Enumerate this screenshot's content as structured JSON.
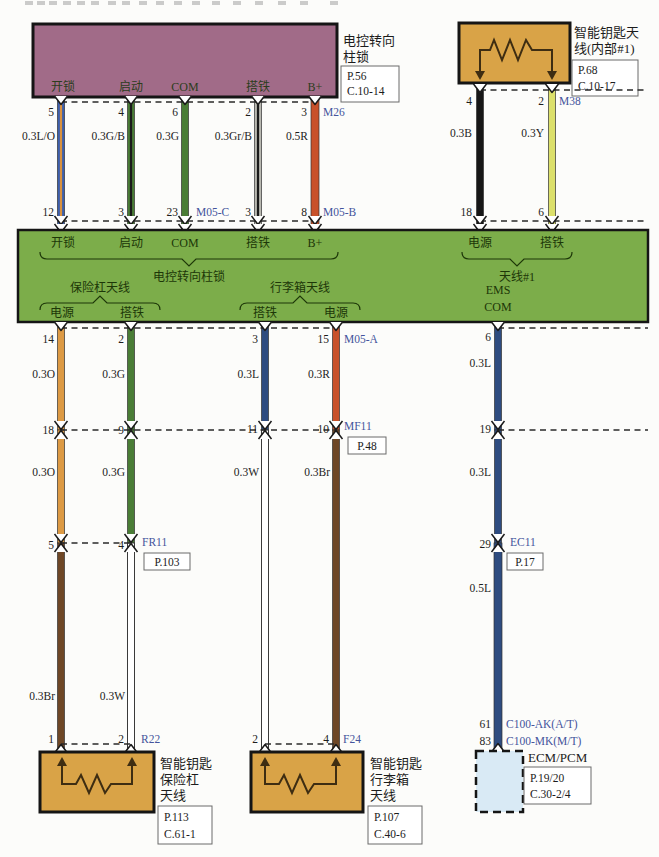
{
  "colors": {
    "purple_box": "#a16b88",
    "green_band": "#7cad4a",
    "orange_box": "#d9a347",
    "ecm_box": "#d9eaf5",
    "wire_blue": "#3c5fae",
    "wire_blue_stripe": "#d8913f",
    "wire_green": "#4a7d36",
    "wire_gray": "#b9b9b1",
    "wire_red": "#c8512a",
    "wire_black": "#161616",
    "wire_yellow": "#dce06b",
    "wire_orange": "#dd9a44",
    "wire_navy": "#2e4c80",
    "wire_brown": "#6e4726",
    "wire_white": "#ffffff",
    "stripe_black": "#1a1a1a",
    "connector_text": "#44549c"
  },
  "steering_lock": {
    "name1": "电控转向",
    "name2": "柱锁",
    "ref1": "P.56",
    "ref2": "C.10-14",
    "pins": [
      "开锁",
      "启动",
      "COM",
      "搭铁",
      "B+"
    ],
    "top_nums": [
      "5",
      "4",
      "6",
      "2",
      "3"
    ],
    "wires": [
      "0.3L/O",
      "0.3G/B",
      "0.3G",
      "0.3Gr/B",
      "0.5R"
    ],
    "bot_nums": [
      "12",
      "3",
      "23",
      "3",
      "8"
    ],
    "conn_top": "M26",
    "conn_bot1": "M05-C",
    "conn_bot2": "M05-B"
  },
  "antenna1": {
    "name1": "智能钥匙天",
    "name2": "线(内部#1)",
    "ref1": "P.68",
    "ref2": "C.10-17",
    "conn": "M38",
    "top_nums": [
      "4",
      "2"
    ],
    "wires": [
      "0.3B",
      "0.3Y"
    ],
    "bot_nums": [
      "18",
      "6"
    ]
  },
  "band": {
    "top_pins": [
      "开锁",
      "启动",
      "COM",
      "搭铁",
      "B+"
    ],
    "group_lock": "电控转向柱锁",
    "ant1_pins": [
      "电源",
      "搭铁"
    ],
    "group_ant1": "天线#1",
    "group_bumper": "保险杠天线",
    "bumper_pins": [
      "电源",
      "搭铁"
    ],
    "group_trunk": "行李箱天线",
    "trunk_pins": [
      "搭铁",
      "电源"
    ],
    "ems1": "EMS",
    "ems2": "COM"
  },
  "mid": {
    "pin_nums": [
      "14",
      "2",
      "3",
      "15"
    ],
    "conn": "M05-A",
    "ems_pin": "6",
    "wires1": [
      "0.3O",
      "0.3G",
      "0.3L",
      "0.3R"
    ],
    "ems_wire1": "0.3L",
    "mf11_nums": [
      "18",
      "9",
      "11",
      "10"
    ],
    "mf11": "MF11",
    "mf11_ref": "P.48",
    "ems_j1": "19",
    "wires2": [
      "0.3O",
      "0.3G",
      "0.3W",
      "0.3Br"
    ],
    "ems_wire2": "0.3L",
    "fr11_nums": [
      "5",
      "4"
    ],
    "fr11": "FR11",
    "fr11_ref": "P.103",
    "ec11_num": "29",
    "ec11": "EC11",
    "ec11_ref": "P.17",
    "ems_wire3": "0.5L",
    "wires3": [
      "0.3Br",
      "0.3W"
    ],
    "bot_nums": [
      "1",
      "2",
      "2",
      "4"
    ],
    "r22": "R22",
    "f24": "F24"
  },
  "bumper_ant": {
    "name1": "智能钥匙",
    "name2": "保险杠",
    "name3": "天线",
    "ref1": "P.113",
    "ref2": "C.61-1"
  },
  "trunk_ant": {
    "name1": "智能钥匙",
    "name2": "行李箱",
    "name3": "天线",
    "ref1": "P.107",
    "ref2": "C.40-6"
  },
  "ecm": {
    "num1": "61",
    "num2": "83",
    "conn1": "C100-AK(A/T)",
    "conn2": "C100-MK(M/T)",
    "name": "ECM/PCM",
    "ref1": "P.19/20",
    "ref2": "C.30-2/4"
  }
}
